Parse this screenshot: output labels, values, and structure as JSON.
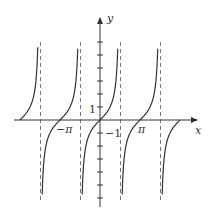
{
  "figure": {
    "function": "y = tan x",
    "axes": {
      "x_label": "x",
      "y_label": "y"
    },
    "tick_labels": {
      "y_one": "1",
      "x_neg_one": "−1",
      "x_neg_pi": "−π",
      "x_pi": "π"
    },
    "colors": {
      "curve": "#333333",
      "axis": "#333333",
      "asymptote": "#555555"
    }
  },
  "chart_data": {
    "type": "line",
    "title": "",
    "xlabel": "x",
    "ylabel": "y",
    "series": [
      {
        "name": "tan x",
        "expression": "tan(x)"
      }
    ],
    "x_range": [
      -6.28,
      6.28
    ],
    "y_range": [
      -7,
      6
    ],
    "asymptotes": [
      "-3π/2",
      "-π/2",
      "π/2",
      "3π/2"
    ],
    "zeros": [
      "-π",
      "0",
      "π"
    ],
    "grid": false,
    "legend": "none"
  }
}
